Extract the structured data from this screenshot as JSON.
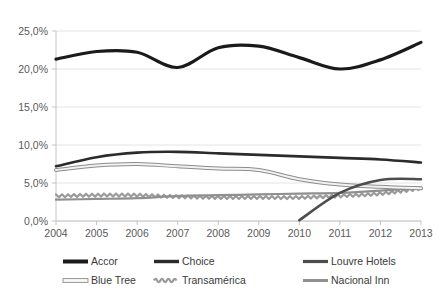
{
  "chart_data": {
    "type": "line",
    "title": "",
    "subtitle": "",
    "xlabel": "",
    "ylabel": "",
    "x": [
      2004,
      2005,
      2006,
      2007,
      2008,
      2009,
      2010,
      2011,
      2012,
      2013
    ],
    "categories": [
      "2004",
      "2005",
      "2006",
      "2007",
      "2008",
      "2009",
      "2010",
      "2011",
      "2012",
      "2013"
    ],
    "ylim": [
      0,
      25
    ],
    "yticks": [
      0,
      5,
      10,
      15,
      20,
      25
    ],
    "ytick_labels": [
      "0,0%",
      "5,0%",
      "10,0%",
      "15,0%",
      "20,0%",
      "25,0%"
    ],
    "xtick_labels": [
      "2004",
      "2005",
      "2006",
      "2007",
      "2008",
      "2009",
      "2010",
      "2011",
      "2012",
      "2013"
    ],
    "grid": true,
    "grid_axis": "y",
    "legend_position": "bottom",
    "legend_columns": 3,
    "series": [
      {
        "name": "Accor",
        "color": "#1a1a1a",
        "width": 3.2,
        "style": "solid",
        "values": [
          21.3,
          22.3,
          22.2,
          20.2,
          22.8,
          23.0,
          21.5,
          20.0,
          21.2,
          23.5
        ]
      },
      {
        "name": "Choice",
        "color": "#2b2b2b",
        "width": 2.6,
        "style": "solid",
        "values": [
          7.2,
          8.4,
          9.0,
          9.1,
          8.9,
          8.7,
          8.5,
          8.3,
          8.1,
          7.7
        ]
      },
      {
        "name": "Louvre Hotels",
        "color": "#4d4d4d",
        "width": 2.6,
        "style": "solid",
        "values": [
          null,
          null,
          null,
          null,
          null,
          null,
          0.1,
          3.7,
          5.4,
          5.5
        ]
      },
      {
        "name": "Blue Tree",
        "color": "#f2f2f2",
        "outline": "#8c8c8c",
        "width": 2.4,
        "style": "outlined",
        "values": [
          6.7,
          7.3,
          7.5,
          7.2,
          6.9,
          6.7,
          5.5,
          4.8,
          4.5,
          4.3
        ]
      },
      {
        "name": "Transamérica",
        "color": "#9a9a9a",
        "width": 2.2,
        "style": "wavy",
        "values": [
          3.3,
          3.4,
          3.4,
          3.2,
          3.1,
          3.1,
          3.1,
          3.3,
          3.6,
          4.3
        ]
      },
      {
        "name": "Nacional Inn",
        "color": "#8f8f8f",
        "width": 2.2,
        "style": "solid",
        "values": [
          2.8,
          2.9,
          3.0,
          3.3,
          3.4,
          3.5,
          3.6,
          3.7,
          4.0,
          4.4
        ]
      }
    ]
  },
  "legend": {
    "items": [
      {
        "label": "Accor",
        "marker": "accor-line-swatch"
      },
      {
        "label": "Choice",
        "marker": "choice-line-swatch"
      },
      {
        "label": "Louvre Hotels",
        "marker": "louvre-hotels-line-swatch"
      },
      {
        "label": "Blue Tree",
        "marker": "blue-tree-line-swatch"
      },
      {
        "label": "Transamérica",
        "marker": "transamerica-line-swatch"
      },
      {
        "label": "Nacional Inn",
        "marker": "nacional-inn-line-swatch"
      }
    ]
  },
  "colors": {
    "background": "#ffffff",
    "grid": "#e4e4e4",
    "axis": "#c4c4c4",
    "tick_text": "#5a5a5a"
  }
}
